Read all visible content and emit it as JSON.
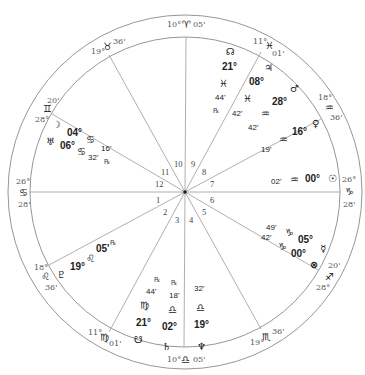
{
  "chart": {
    "center": [
      185,
      192
    ],
    "outer_radius": 177,
    "inner_radius": 161,
    "line_color": "#8a8a8a"
  },
  "cusps": [
    {
      "house": 1,
      "angle": 180,
      "deg": "26°",
      "sign": "♋",
      "sign_name": "cancer",
      "min": "28'",
      "x": 10,
      "y_deg": 182,
      "y_sign": 194,
      "y_min": 206
    },
    {
      "house": 2,
      "angle": 207,
      "deg": "18°",
      "sign": "♌",
      "sign_name": "leo",
      "min": "36'"
    },
    {
      "house": 3,
      "angle": 236,
      "deg": "11°",
      "sign": "♍",
      "sign_name": "virgo",
      "min": "01'"
    },
    {
      "house": 4,
      "angle": 270,
      "deg": "10°",
      "sign": "♎",
      "sign_name": "libra",
      "min": "05'"
    },
    {
      "house": 5,
      "angle": 300,
      "deg": "19°",
      "sign": "♏",
      "sign_name": "scorpio",
      "min": "36'"
    },
    {
      "house": 6,
      "angle": 330,
      "deg": "28°",
      "sign": "♐",
      "sign_name": "sagittarius",
      "min": "20'"
    },
    {
      "house": 7,
      "angle": 0,
      "deg": "26°",
      "sign": "♑",
      "sign_name": "capricorn",
      "min": "28'"
    },
    {
      "house": 8,
      "angle": 27,
      "deg": "18°",
      "sign": "♒",
      "sign_name": "aquarius",
      "min": "36'"
    },
    {
      "house": 9,
      "angle": 56,
      "deg": "11°",
      "sign": "♓",
      "sign_name": "pisces",
      "min": "01'"
    },
    {
      "house": 10,
      "angle": 90,
      "deg": "10°",
      "sign": "♈",
      "sign_name": "aries",
      "min": "05'"
    },
    {
      "house": 11,
      "angle": 120,
      "deg": "19°",
      "sign": "♉",
      "sign_name": "taurus",
      "min": "36'"
    },
    {
      "house": 12,
      "angle": 150,
      "deg": "28°",
      "sign": "♊",
      "sign_name": "gemini",
      "min": "20'"
    }
  ],
  "house_numbers": [
    "1",
    "2",
    "3",
    "4",
    "5",
    "6",
    "7",
    "8",
    "9",
    "10",
    "11",
    "12"
  ],
  "cusp_labels": {
    "mc": {
      "deg": "10°",
      "sign": "♈",
      "min": "05'"
    },
    "ic": {
      "deg": "10°",
      "sign": "♎",
      "min": "05'"
    },
    "asc": {
      "deg": "26°",
      "sign": "♋",
      "min": "28'"
    },
    "dsc": {
      "deg": "26°",
      "sign": "♑",
      "min": "28'"
    },
    "c11": {
      "deg": "19°",
      "sign": "♉",
      "min": "36'"
    },
    "c12": {
      "deg": "28°",
      "sign": "♊",
      "min": "20'"
    },
    "c2": {
      "deg": "18°",
      "sign": "♌",
      "min": "36'"
    },
    "c3": {
      "deg": "11°",
      "sign": "♍",
      "min": "01'"
    },
    "c5": {
      "deg": "19°",
      "sign": "♏",
      "min": "36'"
    },
    "c6": {
      "deg": "28°",
      "sign": "♐",
      "min": "20'"
    },
    "c8": {
      "deg": "18°",
      "sign": "♒",
      "min": "36'"
    },
    "c9": {
      "deg": "11°",
      "sign": "♓",
      "min": "01'"
    }
  },
  "planets": {
    "north_node": {
      "glyph": "☊",
      "name": "north-node",
      "deg": "21°",
      "sign": "♓",
      "min": "44'",
      "retro": "℞"
    },
    "jupiter": {
      "glyph": "♃",
      "name": "jupiter",
      "deg": "08°",
      "sign": "♓",
      "min": "42'"
    },
    "mars": {
      "glyph": "♂",
      "name": "mars",
      "deg": "28°",
      "sign": "♒",
      "min": "42'"
    },
    "venus": {
      "glyph": "♀",
      "name": "venus",
      "deg": "16°",
      "sign": "♒",
      "min": "19'"
    },
    "sun": {
      "glyph": "☉",
      "name": "sun",
      "deg": "00°",
      "sign": "♒",
      "min": "02'"
    },
    "mercury": {
      "glyph": "☿",
      "name": "mercury",
      "deg": "05°",
      "sign": "♑",
      "min": "49'",
      "retro": "℞"
    },
    "part_of_fortune": {
      "glyph": "⊗",
      "name": "part-of-fortune",
      "deg": "00°",
      "sign": "♑",
      "min": "42'"
    },
    "neptune": {
      "glyph": "♆",
      "name": "neptune",
      "deg": "19°",
      "sign": "♎",
      "min": "32'"
    },
    "saturn": {
      "glyph": "♄",
      "name": "saturn",
      "deg": "02°",
      "sign": "♎",
      "min": "18'",
      "retro": "℞"
    },
    "south_node": {
      "glyph": "☋",
      "name": "south-node",
      "deg": "21°",
      "sign": "♍",
      "min": "44'",
      "retro": "℞"
    },
    "pluto": {
      "glyph": "♇",
      "name": "pluto",
      "deg": "19°",
      "sign": "♌",
      "min": "05'",
      "retro": "℞"
    },
    "moon": {
      "glyph": "☽",
      "name": "moon",
      "deg": "04°",
      "sign": "♋",
      "min": "16'",
      "retro": "℞"
    },
    "uranus": {
      "glyph": "♅",
      "name": "uranus",
      "deg": "06°",
      "sign": "♋",
      "min": "32'"
    }
  }
}
